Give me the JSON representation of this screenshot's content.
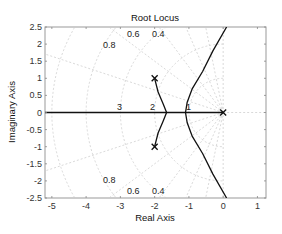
{
  "chart_data": {
    "type": "line",
    "title": "Root Locus",
    "xlabel": "Real Axis",
    "ylabel": "Imaginary Axis",
    "xlim": [
      -5.2,
      1.25
    ],
    "ylim": [
      -2.5,
      2.5
    ],
    "xticks": [
      "-5",
      "-4",
      "-3",
      "-2",
      "-1",
      "0",
      "1"
    ],
    "yticks": [
      "2.5",
      "2",
      "1.5",
      "1",
      "0.5",
      "0",
      "-0.5",
      "-1",
      "-1.5",
      "-2",
      "-2.5"
    ],
    "grid": true,
    "poles": [
      {
        "x": 0,
        "y": 0
      },
      {
        "x": -2,
        "y": 1
      },
      {
        "x": -2,
        "y": -1
      }
    ],
    "damping_labels": [
      "0.8",
      "0.6",
      "0.4"
    ],
    "wn_labels": [
      "3",
      "2",
      "1"
    ],
    "series": [
      {
        "name": "real-axis branch",
        "points": [
          [
            -5.2,
            0
          ],
          [
            0,
            0
          ]
        ]
      },
      {
        "name": "complex branch upper",
        "points": [
          [
            -2,
            1
          ],
          [
            -1.9,
            0.6
          ],
          [
            -1.75,
            0.25
          ],
          [
            -1.65,
            0
          ]
        ]
      },
      {
        "name": "complex branch lower",
        "points": [
          [
            -2,
            -1
          ],
          [
            -1.9,
            -0.6
          ],
          [
            -1.75,
            -0.25
          ],
          [
            -1.65,
            0
          ]
        ]
      },
      {
        "name": "right branch upper",
        "points": [
          [
            -1.1,
            0
          ],
          [
            -1.05,
            0.3
          ],
          [
            -0.9,
            0.7
          ],
          [
            -0.6,
            1.2
          ],
          [
            -0.3,
            1.8
          ],
          [
            0.1,
            2.5
          ]
        ]
      },
      {
        "name": "right branch lower",
        "points": [
          [
            -1.1,
            0
          ],
          [
            -1.05,
            -0.3
          ],
          [
            -0.9,
            -0.7
          ],
          [
            -0.6,
            -1.2
          ],
          [
            -0.3,
            -1.8
          ],
          [
            0.1,
            -2.5
          ]
        ]
      }
    ]
  }
}
